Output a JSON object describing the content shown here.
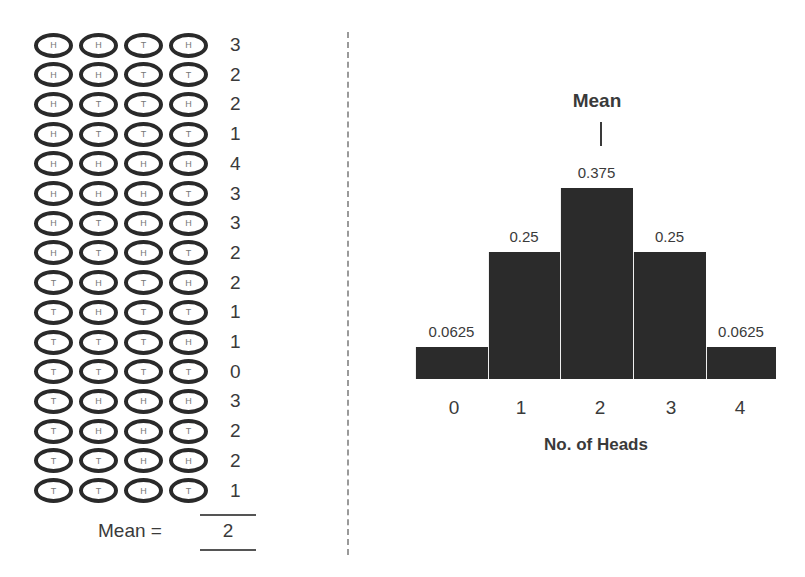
{
  "left_panel": {
    "rows": [
      {
        "coins": [
          "H",
          "H",
          "T",
          "H"
        ],
        "count": "3"
      },
      {
        "coins": [
          "H",
          "H",
          "T",
          "T"
        ],
        "count": "2"
      },
      {
        "coins": [
          "H",
          "T",
          "T",
          "H"
        ],
        "count": "2"
      },
      {
        "coins": [
          "H",
          "T",
          "T",
          "T"
        ],
        "count": "1"
      },
      {
        "coins": [
          "H",
          "H",
          "H",
          "H"
        ],
        "count": "4"
      },
      {
        "coins": [
          "H",
          "H",
          "H",
          "T"
        ],
        "count": "3"
      },
      {
        "coins": [
          "H",
          "T",
          "H",
          "H"
        ],
        "count": "3"
      },
      {
        "coins": [
          "H",
          "T",
          "H",
          "T"
        ],
        "count": "2"
      },
      {
        "coins": [
          "T",
          "H",
          "T",
          "H"
        ],
        "count": "2"
      },
      {
        "coins": [
          "T",
          "H",
          "T",
          "T"
        ],
        "count": "1"
      },
      {
        "coins": [
          "T",
          "T",
          "T",
          "H"
        ],
        "count": "1"
      },
      {
        "coins": [
          "T",
          "T",
          "T",
          "T"
        ],
        "count": "0"
      },
      {
        "coins": [
          "T",
          "H",
          "H",
          "H"
        ],
        "count": "3"
      },
      {
        "coins": [
          "T",
          "H",
          "H",
          "T"
        ],
        "count": "2"
      },
      {
        "coins": [
          "T",
          "T",
          "H",
          "H"
        ],
        "count": "2"
      },
      {
        "coins": [
          "T",
          "T",
          "H",
          "T"
        ],
        "count": "1"
      }
    ],
    "mean_label": "Mean =",
    "mean_value": "2"
  },
  "chart": {
    "mean_marker_label": "Mean",
    "bar_color": "#2b2b2b"
  },
  "chart_data": {
    "type": "bar",
    "title": "",
    "categories": [
      "0",
      "1",
      "2",
      "3",
      "4"
    ],
    "values": [
      0.0625,
      0.25,
      0.375,
      0.25,
      0.0625
    ],
    "value_labels": [
      "0.0625",
      "0.25",
      "0.375",
      "0.25",
      "0.0625"
    ],
    "xlabel": "No. of Heads",
    "ylabel": "",
    "ylim": [
      0,
      0.375
    ],
    "grid": false,
    "legend": null,
    "annotations": [
      {
        "text": "Mean",
        "x": "2",
        "type": "vertical-tick"
      }
    ]
  }
}
